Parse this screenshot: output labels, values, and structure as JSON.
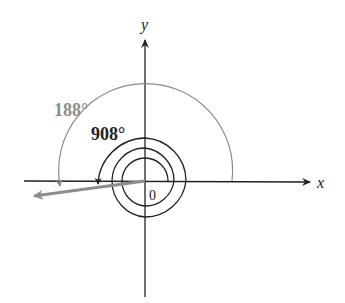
{
  "diagram": {
    "type": "coterminal-angles",
    "axes": {
      "x_label": "x",
      "y_label": "y",
      "origin_label": "0"
    },
    "angles": [
      {
        "name": "small-angle",
        "label": "188°",
        "degrees": 188,
        "color": "#8c8c8c"
      },
      {
        "name": "large-angle",
        "label": "908°",
        "degrees": 908,
        "color": "#222222"
      }
    ],
    "colors": {
      "axis": "#222222",
      "terminal_ray": "#8c8c8c",
      "background": "#ffffff"
    }
  }
}
